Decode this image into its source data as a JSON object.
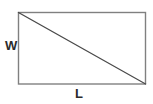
{
  "figure": {
    "background_color": "#ffffff",
    "rectangle": {
      "name": "rectangle-outline",
      "x": 18.5,
      "y": 12.5,
      "width": 127,
      "height": 71.5,
      "stroke_color": "#808080",
      "stroke_width": 1.4,
      "fill": "none"
    },
    "diagonal": {
      "name": "diagonal-line",
      "x1": 18.5,
      "y1": 12.5,
      "x2": 145.5,
      "y2": 84,
      "stroke_color": "#4a4a4a",
      "stroke_width": 1.2
    },
    "labels": {
      "width_label": "W",
      "length_label": "L",
      "text_color": "#2b2b2b"
    }
  }
}
